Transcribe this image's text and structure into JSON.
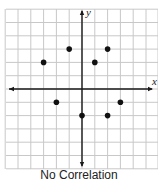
{
  "chart_data": {
    "type": "scatter",
    "title": "",
    "caption": "No Correlation",
    "xlabel": "x",
    "ylabel": "y",
    "xlim": [
      -6,
      6
    ],
    "ylim": [
      -6,
      6
    ],
    "grid": true,
    "points": [
      {
        "x": -3,
        "y": 2
      },
      {
        "x": -1,
        "y": 3
      },
      {
        "x": 1,
        "y": 2
      },
      {
        "x": 2,
        "y": 3
      },
      {
        "x": -2,
        "y": -1
      },
      {
        "x": 3,
        "y": -1
      },
      {
        "x": 0,
        "y": -2
      },
      {
        "x": 2,
        "y": -2
      }
    ],
    "colors": {
      "grid": "#c8c8c8",
      "axis": "#1a1a1a",
      "point": "#111111"
    }
  }
}
